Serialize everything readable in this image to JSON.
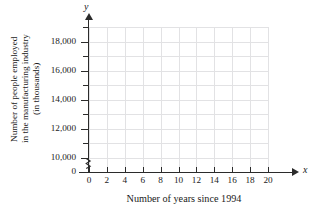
{
  "chart_data": {
    "type": "scatter",
    "title": "",
    "subtitle": "",
    "xlabel": "Number of years since 1994",
    "ylabel_lines": [
      "Number of people employed",
      "in the manufacturing industry",
      "(in thousands)"
    ],
    "ylabel": "Number of people employed in the manufacturing industry (in thousands)",
    "x_axis_symbol": "x",
    "y_axis_symbol": "y",
    "xlim": [
      0,
      20
    ],
    "ylim": [
      9000,
      19000
    ],
    "y_axis_broken": true,
    "y_origin_label": "0",
    "xticks": [
      0,
      2,
      4,
      6,
      8,
      10,
      12,
      14,
      16,
      18,
      20
    ],
    "xtick_labels": [
      "0",
      "2",
      "4",
      "6",
      "8",
      "10",
      "12",
      "14",
      "16",
      "18",
      "20"
    ],
    "yticks_major": [
      10000,
      12000,
      14000,
      16000,
      18000
    ],
    "ytick_labels": [
      "10,000",
      "12,000",
      "14,000",
      "16,000",
      "18,000"
    ],
    "yticks_minor": [
      9000,
      11000,
      13000,
      15000,
      17000,
      19000
    ],
    "grid": true,
    "grid_color": "#e2e2e4",
    "axis_color": "#2b2b2b",
    "background": "#ffffff",
    "legend": null,
    "legend_position": "none",
    "series": [],
    "values": [],
    "categories": [],
    "annotations": [],
    "note": "Empty coordinate grid with no plotted data points"
  }
}
